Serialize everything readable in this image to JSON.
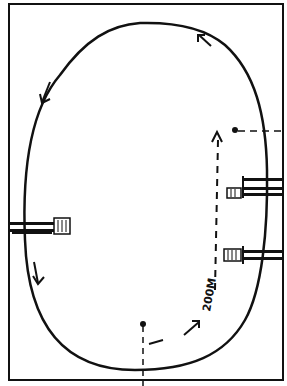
{
  "diagram": {
    "type": "running-track-sketch",
    "colors": {
      "ink": "#111111",
      "background": "#ffffff"
    },
    "distance_label": "200M",
    "elements": {
      "frame": "outer border rectangle",
      "track": "oval track loop",
      "direction_arrows": [
        "top-right arrow pointing counter-clockwise",
        "upper-left arrow pointing down",
        "lower-left arrow pointing down"
      ],
      "start_marker": "dot with dashed line at bottom center",
      "finish_marker": "dot with dashed line at right side",
      "path": "dashed arrow from start to finish along right straight",
      "hurdles": [
        "left hurdle",
        "right upper hurdle",
        "right lower hurdle"
      ]
    }
  }
}
